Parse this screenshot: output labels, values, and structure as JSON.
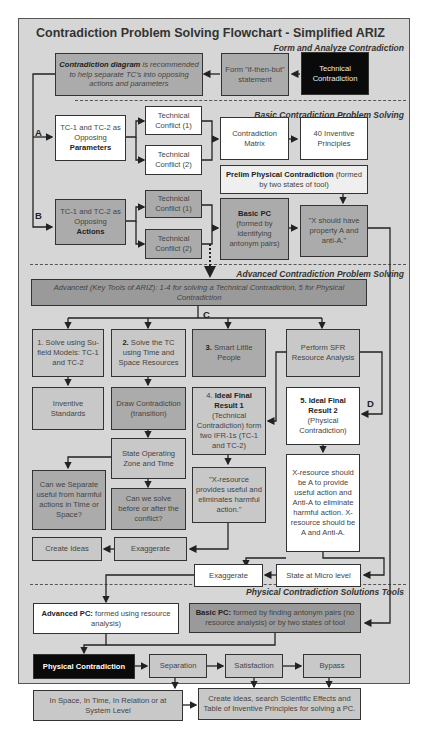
{
  "title": "Contradiction Problem Solving Flowchart - Simplified ARIZ",
  "sections": {
    "form": "Form and Analyze Contradiction",
    "basic": "Basic Contradiction Problem Solving",
    "advanced": "Advanced Contradiction Problem Solving",
    "pc_tools": "Physical Contradiction Solutions Tools"
  },
  "labels": {
    "a": "A",
    "b": "B",
    "c": "C",
    "d": "D"
  },
  "form": {
    "technical_contradiction": "Technical Contradiction",
    "if_then_but": "Form \"if-then-but\" statement",
    "diagram_bold": "Contradiction diagram",
    "diagram_rest": " is recommended to help separate TC's into opposing actions and parameters"
  },
  "basic": {
    "params_line1": "TC-1 and TC-2 as Opposing",
    "params_bold": "Parameters",
    "tc1_a": "Technical Conflict (1)",
    "tc2_a": "Technical Conflict (2)",
    "matrix": "Contradiction Matrix",
    "principles": "40 Inventive Principles",
    "prelim_bold": "Prelim Physical Contradiction",
    "prelim_rest": " (formed by two states of tool)",
    "actions_line1": "TC-1 and TC-2 as Opposing",
    "actions_bold": "Actions",
    "tc1_b": "Technical Conflict (1)",
    "tc2_b": "Technical Conflict (2)",
    "basic_pc_bold": "Basic PC",
    "basic_pc_rest": "(formed by identifying antonym pairs)",
    "x_should": "\"X should have property A and anti-A.\""
  },
  "advanced": {
    "banner_italic": "Advanced (Key Tools of ARIZ)",
    "banner_rest": ": 1-4 for solving a Technical Contradiction, 5 for Physical Contradiction",
    "su_field": "1. Solve using Su-field Models: TC-1 and TC-2",
    "solve_tc_num": "2.",
    "solve_tc": " Solve the TC using Time and Space Resources",
    "little_people_num": "3.",
    "little_people": " Smart Little People",
    "sfr": "Perform SFR Resource Analysis",
    "inventive_standards": "Inventive Standards",
    "draw_contradiction": "Draw Contradiction (transition)",
    "ifr1_num": "4. ",
    "ifr1_bold": "Ideal Final Result 1",
    "ifr1_rest": "(Technical Contradiction) form two IFR-1s (TC-1 and TC-2)",
    "ifr2_bold": "5. Ideal Final Result 2",
    "ifr2_rest": "(Physical Contradiction)",
    "state_zone": "State Operating Zone and Time",
    "separate": "Can we Separate useful from harmful actions in Time or Space?",
    "before_after": "Can we solve before or after the conflict?",
    "x_resource_quote": "\"X-resource provides useful and eliminates harmful action.\"",
    "x_resource_long": "X-resource should be A to provide useful action and Anti-A to eliminate harmful action. X-resource should be A and Anti-A.",
    "create_ideas": "Create Ideas",
    "exaggerate_1": "Exaggerate",
    "exaggerate_2": "Exaggerate",
    "micro_level": "State at Micro level"
  },
  "pc_tools": {
    "advanced_pc_bold": "Advanced PC:",
    "advanced_pc_rest": " formed using resource analysis)",
    "basic_pc_bold": "Basic PC:",
    "basic_pc_rest": " formed by finding antonym pairs (no resource analysis) or by two states of tool",
    "physical_contradiction": "Physical Contradiction",
    "separation": "Separation",
    "satisfaction": "Satisfaction",
    "bypass": "Bypass",
    "in_space": "In Space, In Time, In Relation or at System Level",
    "create_ideas_pc": "Create ideas, search Scientific Effects and Table of Inventive Principles for solving a PC."
  },
  "colors": {
    "frame_bg": "#d6d6d6",
    "box_white": "#ffffff",
    "box_light_gray": "#c8c8c8",
    "box_mid_gray": "#ababab",
    "box_dark_gray": "#9a9a9a",
    "box_black": "#0a0a0a"
  }
}
